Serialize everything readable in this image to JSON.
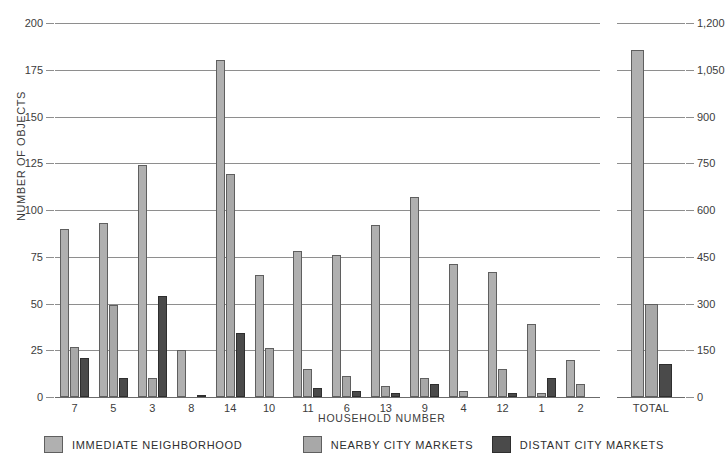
{
  "chart_data": {
    "type": "bar",
    "title": "",
    "xlabel": "HOUSEHOLD NUMBER",
    "ylabel": "NUMBER OF OBJECTS",
    "grid": true,
    "legend_position": "bottom",
    "categories": [
      "7",
      "5",
      "3",
      "8",
      "14",
      "10",
      "11",
      "6",
      "13",
      "9",
      "4",
      "12",
      "1",
      "2"
    ],
    "total_category": "TOTAL",
    "ylim": [
      0,
      200
    ],
    "yticks": [
      0,
      25,
      50,
      75,
      100,
      125,
      150,
      175,
      200
    ],
    "ytick_labels": [
      "0",
      "25",
      "50",
      "75",
      "100",
      "125",
      "150",
      "175",
      "200"
    ],
    "y2lim": [
      0,
      1200
    ],
    "y2ticks": [
      0,
      150,
      300,
      450,
      600,
      750,
      900,
      1050,
      1200
    ],
    "y2tick_labels": [
      "0",
      "150",
      "300",
      "450",
      "600",
      "750",
      "900",
      "1,050",
      "1,200"
    ],
    "series": [
      {
        "name": "IMMEDIATE NEIGHBORHOOD",
        "color": "#b0b0b0",
        "values": [
          90,
          93,
          124,
          25,
          180,
          65,
          78,
          76,
          92,
          107,
          71,
          67,
          39,
          20
        ],
        "total": 1115
      },
      {
        "name": "NEARBY CITY MARKETS",
        "color": "#a8a8a8",
        "values": [
          27,
          49,
          10,
          0,
          119,
          26,
          15,
          11,
          6,
          10,
          3,
          15,
          2,
          7
        ],
        "total": 300
      },
      {
        "name": "DISTANT CITY MARKETS",
        "color": "#4a4a4a",
        "values": [
          21,
          10,
          54,
          1,
          34,
          0,
          5,
          3,
          2,
          7,
          0,
          2,
          10,
          0
        ],
        "total": 105
      }
    ]
  }
}
